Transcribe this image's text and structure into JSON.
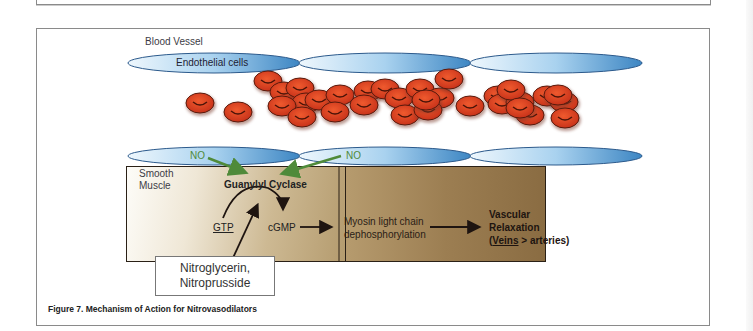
{
  "figure": {
    "caption": "Figure 7. Mechanism of Action for Nitrovasodilators",
    "title_label": "Blood Vessel",
    "endothelial_label": "Endothelial cells",
    "no_labels": [
      "NO",
      "NO"
    ],
    "smooth_muscle_label_line1": "Smooth",
    "smooth_muscle_label_line2": "Muscle",
    "enzyme_label": "Guanylyl Cyclase",
    "substrate_label": "GTP",
    "product_label": "cGMP",
    "step_label_line1": "Myosin light chain",
    "step_label_line2": "dephosphorylation",
    "outcome_line1": "Vascular",
    "outcome_line2": "Relaxation",
    "outcome_line3_underlined": "Veins",
    "outcome_line3_rest": " > arteries)",
    "outcome_line3_open": "(",
    "drug_line1": "Nitroglycerin,",
    "drug_line2": "Nitroprusside"
  },
  "colors": {
    "endothelium_light": "#dbeefa",
    "endothelium_dark": "#3d8ac6",
    "rbc": "#d9401c",
    "rbc_outline": "#5a1a0c",
    "no_arrow": "#4f8a3a",
    "muscle_dark": "#8a6c42"
  }
}
